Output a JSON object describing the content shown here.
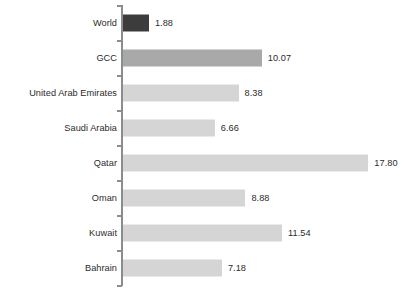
{
  "chart_data": {
    "type": "bar",
    "orientation": "horizontal",
    "title": "",
    "subtitle": "",
    "xlabel": "",
    "ylabel": "",
    "grid": false,
    "legend": "none",
    "xlim": [
      0,
      18.5
    ],
    "value_format": "2-decimal",
    "categories": [
      "World",
      "GCC",
      "United Arab Emirates",
      "Saudi Arabia",
      "Qatar",
      "Oman",
      "Kuwait",
      "Bahrain"
    ],
    "values": [
      1.88,
      10.07,
      8.38,
      6.66,
      17.8,
      8.88,
      11.54,
      7.18
    ],
    "value_labels": [
      "1.88",
      "10.07",
      "8.38",
      "6.66",
      "17.80",
      "8.88",
      "11.54",
      "7.18"
    ],
    "bar_shades": [
      "dark",
      "mid",
      "light",
      "light",
      "light",
      "light",
      "light",
      "light"
    ],
    "colors": {
      "bar_dark": "#3c3c3c",
      "bar_mid": "#a9a9a9",
      "bar_light": "#d5d5d5",
      "axis": "#8c8c8c",
      "text": "#2b2b2b",
      "background": "#ffffff"
    }
  },
  "axis": {
    "tick_count": 9
  }
}
